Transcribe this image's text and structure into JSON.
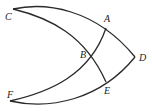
{
  "diagram": {
    "type": "geometry-arcs",
    "stroke_color": "#2a2a2a",
    "points": {
      "A": {
        "label": "A",
        "x": 106,
        "y": 28,
        "lx": 104,
        "ly": 22
      },
      "B": {
        "label": "B",
        "x": 91,
        "y": 55,
        "lx": 80,
        "ly": 58
      },
      "C": {
        "label": "C",
        "x": 13,
        "y": 9,
        "lx": 5,
        "ly": 20
      },
      "D": {
        "label": "D",
        "x": 135,
        "y": 57,
        "lx": 139,
        "ly": 61
      },
      "E": {
        "label": "E",
        "x": 106,
        "y": 82,
        "lx": 104,
        "ly": 94
      },
      "F": {
        "label": "F",
        "x": 10,
        "y": 101,
        "lx": 7,
        "ly": 98
      }
    },
    "arcs": [
      {
        "name": "arc-c-a-d",
        "from": "C",
        "through": "A",
        "to": "D"
      },
      {
        "name": "arc-c-b-e",
        "from": "C",
        "through": "B",
        "to": "E"
      },
      {
        "name": "arc-f-b-a",
        "from": "F",
        "through": "B",
        "to": "A"
      },
      {
        "name": "arc-f-e-d",
        "from": "F",
        "through": "E",
        "to": "D"
      }
    ]
  }
}
